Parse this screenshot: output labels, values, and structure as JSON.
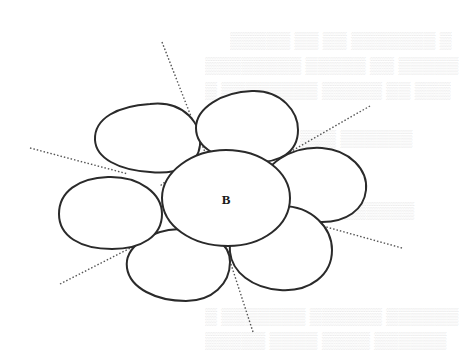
{
  "figure": {
    "type": "cell-packing-diagram",
    "center_label": "B",
    "cell_count": 7,
    "neighbors": [
      "top-left",
      "top-right",
      "right",
      "bottom-right",
      "bottom-left",
      "left"
    ],
    "stroke_color": "#2a2a2a",
    "dotted_line_color": "#555555",
    "background": "#ffffff"
  },
  "bleed_through_text": {
    "visible": true,
    "legible": false,
    "lines": [
      "",
      "",
      "",
      "",
      "",
      "",
      ""
    ]
  }
}
